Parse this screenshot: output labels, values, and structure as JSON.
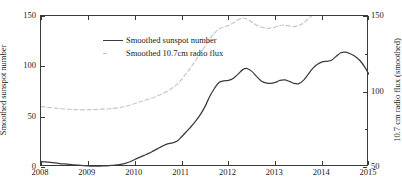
{
  "chart_data": {
    "type": "line",
    "title": "",
    "xlabel": "",
    "ylabel": "Smoothed sunspot number",
    "y2label": "10.7 cm radio flux (smoothed)",
    "xlim": [
      2008,
      2015
    ],
    "ylim": [
      0,
      150
    ],
    "y2lim": [
      50,
      150
    ],
    "grid": false,
    "legend_position": "top-left",
    "xticks": [
      "2008",
      "2009",
      "2010",
      "2011",
      "2012",
      "2013",
      "2014",
      "2015"
    ],
    "xtick_values": [
      2008,
      2009,
      2010,
      2011,
      2012,
      2013,
      2014,
      2015
    ],
    "yticks": [
      "0",
      "50",
      "100",
      "150"
    ],
    "ytick_values": [
      0,
      50,
      100,
      150
    ],
    "y2ticks": [
      "50",
      "100",
      "150"
    ],
    "y2tick_values": [
      50,
      100,
      150
    ],
    "series": [
      {
        "name": "Smoothed sunspot number",
        "axis": "left",
        "color": "#3b3b3b",
        "style": "solid",
        "x": [
          2008.0,
          2008.1,
          2008.2,
          2008.3,
          2008.4,
          2008.5,
          2008.6,
          2008.7,
          2008.8,
          2008.9,
          2009.0,
          2009.1,
          2009.2,
          2009.3,
          2009.4,
          2009.5,
          2009.6,
          2009.7,
          2009.8,
          2009.9,
          2010.0,
          2010.1,
          2010.2,
          2010.3,
          2010.4,
          2010.5,
          2010.6,
          2010.7,
          2010.8,
          2010.9,
          2011.0,
          2011.1,
          2011.2,
          2011.3,
          2011.4,
          2011.5,
          2011.6,
          2011.7,
          2011.8,
          2011.9,
          2012.0,
          2012.1,
          2012.2,
          2012.3,
          2012.4,
          2012.5,
          2012.6,
          2012.7,
          2012.8,
          2012.9,
          2013.0,
          2013.1,
          2013.2,
          2013.3,
          2013.4,
          2013.5,
          2013.6,
          2013.7,
          2013.8,
          2013.9,
          2014.0,
          2014.1,
          2014.2,
          2014.3,
          2014.4,
          2014.5,
          2014.6,
          2014.7,
          2014.8,
          2014.9,
          2015.0
        ],
        "y": [
          5.5,
          5.2,
          4.6,
          4.0,
          3.4,
          3.0,
          2.6,
          2.2,
          1.8,
          1.4,
          1.0,
          0.8,
          0.8,
          1.0,
          1.2,
          1.5,
          2.0,
          2.6,
          3.6,
          5.2,
          7.5,
          9.5,
          11.5,
          13.5,
          16.0,
          18.5,
          21.0,
          23.0,
          24.0,
          25.5,
          30.0,
          35.0,
          40.0,
          45.5,
          52.0,
          60.0,
          70.0,
          78.0,
          84.0,
          85.5,
          86.0,
          88.0,
          92.0,
          96.5,
          97.8,
          95.0,
          90.0,
          85.5,
          83.5,
          83.0,
          84.0,
          86.0,
          86.5,
          85.0,
          83.0,
          82.8,
          86.0,
          92.0,
          98.0,
          102.0,
          104.5,
          105.0,
          106.0,
          110.0,
          113.5,
          114.0,
          112.5,
          110.0,
          106.0,
          100.0,
          92.0
        ]
      },
      {
        "name": "Smoothed 10.7cm radio flux",
        "axis": "right",
        "color": "#c4c4c4",
        "style": "dashed",
        "x": [
          2008.0,
          2008.1,
          2008.2,
          2008.3,
          2008.4,
          2008.5,
          2008.6,
          2008.7,
          2008.8,
          2008.9,
          2009.0,
          2009.1,
          2009.2,
          2009.3,
          2009.4,
          2009.5,
          2009.6,
          2009.7,
          2009.8,
          2009.9,
          2010.0,
          2010.1,
          2010.2,
          2010.3,
          2010.4,
          2010.5,
          2010.6,
          2010.7,
          2010.8,
          2010.9,
          2011.0,
          2011.1,
          2011.2,
          2011.3,
          2011.4,
          2011.5,
          2011.6,
          2011.7,
          2011.8,
          2011.9,
          2012.0,
          2012.1,
          2012.2,
          2012.3,
          2012.4,
          2012.5,
          2012.6,
          2012.7,
          2012.8,
          2012.9,
          2013.0,
          2013.1,
          2013.2,
          2013.3,
          2013.4,
          2013.5,
          2013.6,
          2013.7,
          2013.8,
          2013.9,
          2014.0,
          2014.1,
          2014.2,
          2014.3,
          2014.4,
          2014.5,
          2014.6,
          2014.7,
          2014.8,
          2014.9,
          2015.0
        ],
        "y_left_equiv": [
          30.0,
          29.5,
          29.0,
          28.5,
          28.0,
          27.6,
          27.3,
          27.0,
          26.8,
          26.7,
          26.8,
          27.0,
          27.2,
          27.4,
          27.6,
          28.0,
          28.5,
          29.2,
          30.2,
          31.5,
          33.0,
          34.5,
          36.0,
          37.5,
          39.0,
          41.0,
          43.0,
          45.5,
          48.5,
          52.0,
          57.0,
          63.0,
          69.0,
          76.0,
          83.0,
          90.0,
          97.0,
          103.0,
          107.0,
          109.0,
          110.5,
          113.0,
          116.0,
          118.0,
          117.0,
          114.0,
          111.0,
          109.0,
          108.0,
          108.0,
          109.0,
          110.5,
          111.0,
          110.0,
          109.5,
          110.5,
          113.0,
          117.0,
          121.0,
          125.0,
          128.0,
          130.0,
          132.5,
          136.0,
          139.0,
          140.0,
          138.5,
          136.0,
          133.0,
          129.0,
          124.0
        ],
        "y": [
          90.0,
          89.7,
          89.3,
          89.0,
          88.7,
          88.4,
          88.2,
          88.0,
          87.9,
          87.8,
          87.9,
          88.0,
          88.1,
          88.3,
          88.4,
          88.7,
          89.0,
          89.5,
          90.1,
          91.0,
          92.0,
          93.0,
          94.0,
          95.0,
          96.0,
          97.3,
          98.7,
          100.3,
          102.3,
          104.7,
          108.0,
          112.0,
          116.0,
          120.7,
          125.3,
          130.0,
          134.7,
          138.7,
          141.3,
          142.7,
          143.7,
          145.3,
          147.3,
          148.7,
          148.0,
          146.0,
          144.0,
          142.7,
          142.0,
          142.0,
          142.7,
          143.7,
          144.0,
          143.3,
          143.0,
          143.7,
          145.3,
          148.0,
          150.7,
          153.3,
          155.3,
          156.7,
          158.3,
          160.7,
          162.7,
          163.3,
          162.3,
          160.7,
          158.7,
          156.0,
          152.7
        ]
      }
    ],
    "legend": [
      {
        "label": "Smoothed sunspot number",
        "color": "#3b3b3b",
        "style": "solid"
      },
      {
        "label": "Smoothed 10.7cm radio flux",
        "color": "#c4c4c4",
        "style": "dashed"
      }
    ],
    "colors": {
      "sunspot_line": "#3b3b3b",
      "flux_line": "#c4c4c4",
      "axis": "#3a3a3a",
      "background": "#ffffff"
    }
  }
}
